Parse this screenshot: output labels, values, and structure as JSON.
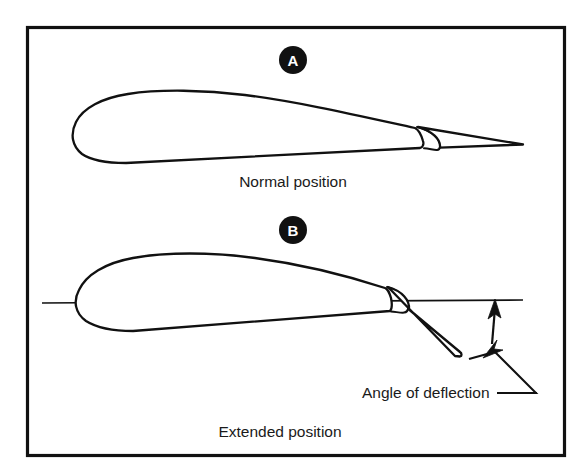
{
  "figure": {
    "background_color": "#ffffff",
    "ink_color": "#111111",
    "frame": {
      "name": "figure-border",
      "x": 26,
      "y": 26,
      "width": 538,
      "height": 430
    }
  },
  "panels": [
    {
      "id": "A",
      "badge_label": "A",
      "caption": "Normal position",
      "description": "Airfoil cross-section with trailing-edge flap retracted flush with the wing contour"
    },
    {
      "id": "B",
      "badge_label": "B",
      "caption": "Extended position",
      "description": "Airfoil cross-section with trailing-edge flap deflected downward below the chord line"
    }
  ],
  "annotations": {
    "angle_callout": {
      "label": "Angle of deflection",
      "icon": "double-headed-arrow",
      "leader": "line from label to double-headed arrow between chord line and deflected flap"
    },
    "chord_reference": {
      "name": "chord-reference-line",
      "description": "Horizontal reference line through the airfoil extending aft past the trailing edge"
    }
  }
}
